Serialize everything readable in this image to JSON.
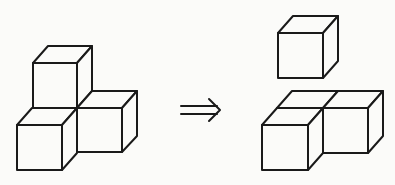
{
  "diagram": {
    "type": "isometric-cube-transformation",
    "colors": {
      "stroke": "#1a1a1a",
      "background": "#fbfbf9"
    },
    "left_figure": {
      "label": "three-cube-L-arrangement",
      "cube_count": 3
    },
    "arrow": {
      "symbol": "⇒",
      "meaning": "implies / transforms-into"
    },
    "right_figure": {
      "label": "separated-cube-plus-two-cube-base",
      "cube_count": 3,
      "parts": [
        "single-cube-top",
        "two-cube-base"
      ]
    }
  }
}
